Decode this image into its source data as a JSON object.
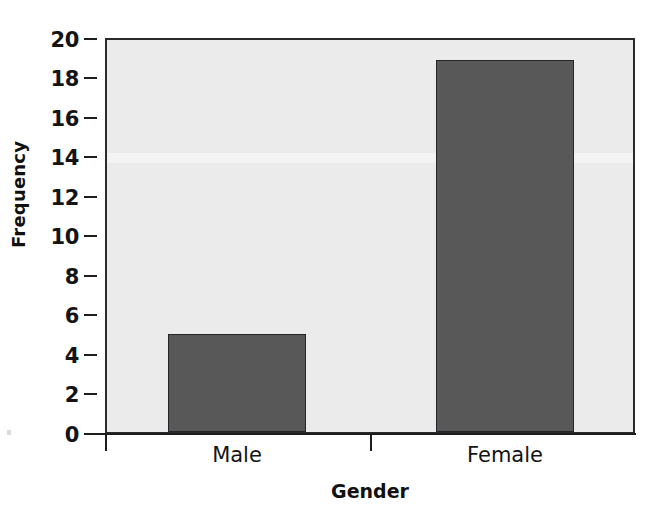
{
  "chart_data": {
    "type": "bar",
    "title": "",
    "subtitle": "",
    "xlabel": "Gender",
    "ylabel": "Frequency",
    "categories": [
      "Male",
      "Female"
    ],
    "values": [
      5,
      19
    ],
    "ylim": [
      0,
      20
    ],
    "ytick_step": 2,
    "yticks": [
      "20",
      "18",
      "16",
      "14",
      "12",
      "10",
      "8",
      "6",
      "4",
      "2",
      "0"
    ],
    "ytick_values": [
      20,
      18,
      16,
      14,
      12,
      10,
      8,
      6,
      4,
      2,
      0
    ],
    "grid": false,
    "legend": null,
    "annotations": [],
    "series": [
      {
        "name": "Frequency",
        "values": [
          5,
          19
        ]
      }
    ]
  },
  "axes": {
    "y_title": "Frequency",
    "x_title": "Gender",
    "x_tick_labels": [
      "Male",
      "Female"
    ]
  },
  "colors": {
    "bar_fill": "#585858",
    "bar_stroke": "#23252a",
    "plot_background": "#ebebeb",
    "frame": "#2a2a2a",
    "text": "#141414",
    "page_background": "#ffffff"
  }
}
